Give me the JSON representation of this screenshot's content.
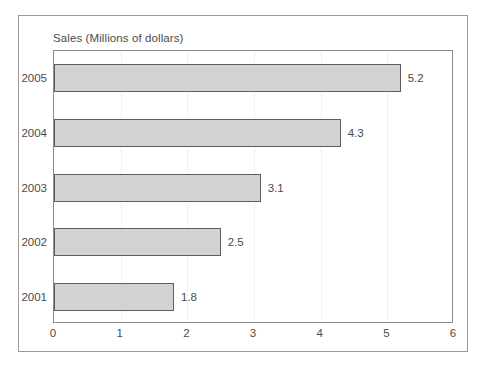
{
  "chart_data": {
    "type": "bar",
    "orientation": "horizontal",
    "title": "Sales (Millions of dollars)",
    "xlabel": "",
    "ylabel": "",
    "categories": [
      "2005",
      "2004",
      "2003",
      "2002",
      "2001"
    ],
    "values": [
      5.2,
      4.3,
      3.1,
      2.5,
      1.8
    ],
    "value_labels": [
      "5.2",
      "4.3",
      "3.1",
      "2.5",
      "1.8"
    ],
    "xlim": [
      0,
      6
    ],
    "xticks": [
      "0",
      "1",
      "2",
      "3",
      "4",
      "5",
      "6"
    ],
    "grid": "vertical-dotted",
    "legend": "none",
    "colors": {
      "bar_fill": "#d2d2d2",
      "bar_border": "#5d5d5d",
      "gridline": "#e2e2e2",
      "axis": "#8c8c8c",
      "frame": "#9a9a9a",
      "text": "#4a4a4a",
      "background": "#ffffff"
    }
  }
}
